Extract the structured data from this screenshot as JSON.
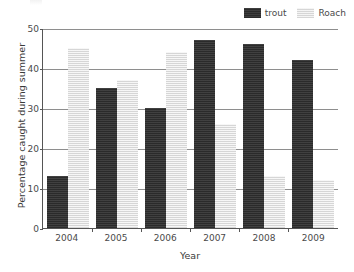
{
  "chart_data": {
    "type": "bar",
    "title": "",
    "categories": [
      "2004",
      "2005",
      "2006",
      "2007",
      "2008",
      "2009"
    ],
    "series": [
      {
        "name": "trout",
        "color": "#2b2b2b",
        "values": [
          13,
          35,
          30,
          47,
          46,
          42
        ]
      },
      {
        "name": "Roach",
        "color": "#d6d6d6",
        "values": [
          45,
          37,
          44,
          26,
          13,
          12
        ]
      }
    ],
    "xlabel": "Year",
    "ylabel": "Percentage caught during summer",
    "ylim": [
      0,
      50
    ],
    "yticks": [
      0,
      10,
      20,
      30,
      40,
      50
    ],
    "ytick_labels": [
      "0",
      "10",
      "20",
      "30",
      "40",
      "50"
    ],
    "grid": true,
    "legend_position": "top-right"
  },
  "legend": {
    "entries": [
      {
        "label": "trout",
        "swatch": "dark-swatch-icon"
      },
      {
        "label": "Roach",
        "swatch": "light-swatch-icon"
      }
    ]
  },
  "axes": {
    "y_title": "Percentage caught during summer",
    "x_title": "Year"
  }
}
